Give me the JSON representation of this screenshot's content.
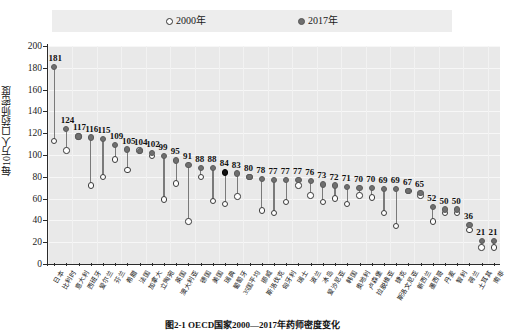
{
  "legend": {
    "items": [
      {
        "label": "2000年",
        "marker": "open-circle-icon",
        "color": "#ffffff"
      },
      {
        "label": "2017年",
        "marker": "filled-circle-icon",
        "color": "#6f6f6f"
      }
    ]
  },
  "caption": "图2-1  OECD国家2000—2017年药师密度变化",
  "chart_data": {
    "type": "scatter",
    "title": "",
    "subtitle": "",
    "xlabel": "",
    "ylabel": "每10万人口药师密度",
    "ylim": [
      0,
      200
    ],
    "ytick_step": 20,
    "yticks": [
      0,
      20,
      40,
      60,
      80,
      100,
      120,
      140,
      160,
      180,
      200
    ],
    "grid": true,
    "legend_position": "top-center",
    "highlight_index": 14,
    "highlight_color": "#111111",
    "categories": [
      "日本",
      "比利时",
      "意大利",
      "西班牙",
      "爱尔兰",
      "芬兰",
      "希腊",
      "法国",
      "加拿大",
      "立陶宛",
      "英国",
      "澳大利亚",
      "德国",
      "美国",
      "瑞典",
      "葡萄牙",
      "35国平均",
      "挪威",
      "斯洛伐克",
      "匈牙利",
      "瑞士",
      "波兰",
      "冰岛",
      "爱沙尼亚",
      "韩国",
      "奥地利",
      "卢森堡",
      "拉脱维亚",
      "捷克",
      "斯洛文尼亚",
      "新西兰",
      "墨西哥",
      "丹麦",
      "智利",
      "荷兰",
      "土耳其",
      "南非"
    ],
    "series": [
      {
        "name": "2017年",
        "marker": "filled-circle",
        "color": "#6f6f6f",
        "values": [
          181,
          124,
          117,
          116,
          115,
          109,
          105,
          104,
          102,
          99,
          95,
          91,
          88,
          88,
          84,
          83,
          80,
          78,
          77,
          77,
          77,
          76,
          73,
          72,
          71,
          70,
          70,
          69,
          69,
          67,
          65,
          52,
          50,
          50,
          36,
          21,
          21
        ]
      },
      {
        "name": "2000年",
        "marker": "open-circle",
        "color": "#ffffff",
        "values": [
          113,
          104,
          117,
          72,
          80,
          96,
          86,
          104,
          99,
          59,
          74,
          39,
          80,
          58,
          55,
          62,
          80,
          49,
          47,
          57,
          72,
          63,
          57,
          60,
          55,
          63,
          61,
          47,
          35,
          67,
          63,
          39,
          47,
          47,
          31,
          15,
          15
        ]
      }
    ]
  }
}
